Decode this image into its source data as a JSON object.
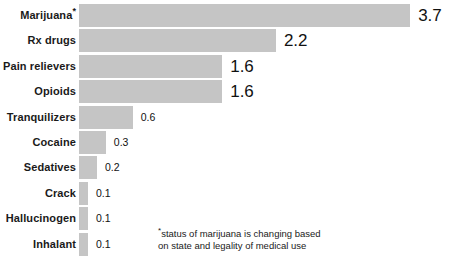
{
  "chart_data": {
    "type": "bar",
    "orientation": "horizontal",
    "title": "",
    "subtitle": "",
    "xlabel": "",
    "ylabel": "",
    "grid": false,
    "legend": null,
    "xlim": [
      0,
      3.7
    ],
    "categories": [
      "Marijuana*",
      "Rx drugs",
      "Pain relievers",
      "Opioids",
      "Tranquilizers",
      "Cocaine",
      "Sedatives",
      "Crack",
      "Hallucinogen",
      "Inhalant"
    ],
    "values": [
      3.7,
      2.2,
      1.6,
      1.6,
      0.6,
      0.3,
      0.2,
      0.1,
      0.1,
      0.1
    ],
    "value_labels": [
      "3.7",
      "2.2",
      "1.6",
      "1.6",
      "0.6",
      "0.3",
      "0.2",
      "0.1",
      "0.1",
      "0.1"
    ],
    "annotations": [
      "*status of marijuana is changing based",
      "on state and legality of medical use"
    ],
    "bar_color": "#c5c5c5",
    "text_color": "#1a1a1a"
  },
  "rows": [
    {
      "label": "Marijuana",
      "has_asterisk": true,
      "value_label": "3.7",
      "value": 3.7
    },
    {
      "label": "Rx drugs",
      "has_asterisk": false,
      "value_label": "2.2",
      "value": 2.2
    },
    {
      "label": "Pain relievers",
      "has_asterisk": false,
      "value_label": "1.6",
      "value": 1.6
    },
    {
      "label": "Opioids",
      "has_asterisk": false,
      "value_label": "1.6",
      "value": 1.6
    },
    {
      "label": "Tranquilizers",
      "has_asterisk": false,
      "value_label": "0.6",
      "value": 0.6
    },
    {
      "label": "Cocaine",
      "has_asterisk": false,
      "value_label": "0.3",
      "value": 0.3
    },
    {
      "label": "Sedatives",
      "has_asterisk": false,
      "value_label": "0.2",
      "value": 0.2
    },
    {
      "label": "Crack",
      "has_asterisk": false,
      "value_label": "0.1",
      "value": 0.1
    },
    {
      "label": "Hallucinogen",
      "has_asterisk": false,
      "value_label": "0.1",
      "value": 0.1
    },
    {
      "label": "Inhalant",
      "has_asterisk": false,
      "value_label": "0.1",
      "value": 0.1
    }
  ],
  "footnote": {
    "asterisk": "*",
    "line1": "status of marijuana is changing based",
    "line2": "on state and legality of medical use"
  }
}
